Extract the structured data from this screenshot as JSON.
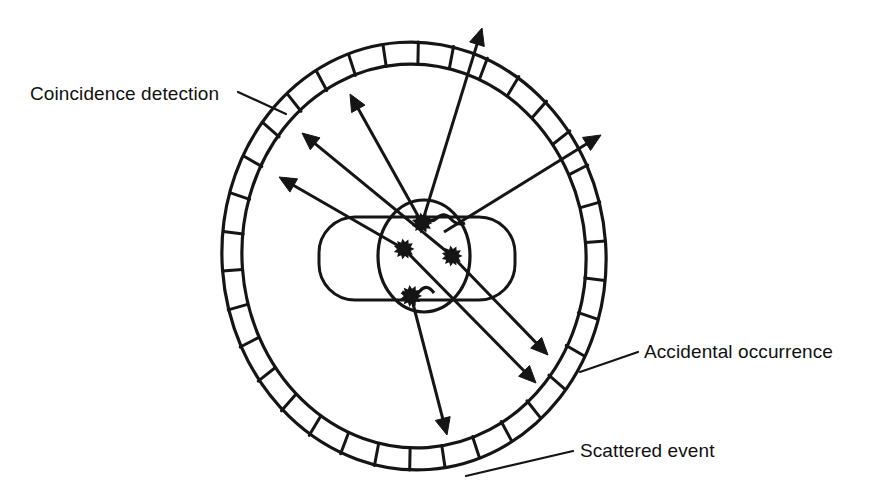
{
  "figure": {
    "background_color": "#ffffff",
    "ink_color": "#151515",
    "width": 878,
    "height": 494
  },
  "labels": [
    {
      "id": "coincidence-detection",
      "text": "Coincidence detection",
      "text_x": 30,
      "text_y": 100,
      "anchor": "start",
      "leader": {
        "x1": 238,
        "y1": 92,
        "x2": 286,
        "y2": 114
      }
    },
    {
      "id": "accidental-occurrence",
      "text": "Accidental occurrence",
      "text_x": 644,
      "text_y": 358,
      "anchor": "start",
      "leader": {
        "x1": 638,
        "y1": 352,
        "x2": 580,
        "y2": 372
      }
    },
    {
      "id": "scattered-event",
      "text": "Scattered event",
      "text_x": 580,
      "text_y": 457,
      "anchor": "start",
      "leader": {
        "x1": 573,
        "y1": 451,
        "x2": 466,
        "y2": 476
      }
    }
  ],
  "detector_ring": {
    "name": "detector-ring",
    "center_x": 414,
    "center_y": 256,
    "outer_rx": 192,
    "outer_ry": 214,
    "inner_rx": 172,
    "inner_ry": 192,
    "block_count": 34,
    "stroke_width": 3.2,
    "rotation_deg": -4
  },
  "patient_bed": {
    "name": "patient-bed",
    "x": 319,
    "y": 217,
    "width": 196,
    "height": 83,
    "corner_radius": 36
  },
  "body_section": {
    "name": "body-cross-section",
    "center_x": 424,
    "center_y": 256,
    "rx": 46,
    "ry": 56
  },
  "event_points": [
    {
      "id": "event-point-1",
      "x": 422,
      "y": 223,
      "r": 9
    },
    {
      "id": "event-point-2",
      "x": 404,
      "y": 249,
      "r": 9
    },
    {
      "id": "event-point-3",
      "x": 452,
      "y": 256,
      "r": 9
    },
    {
      "id": "event-point-4",
      "x": 411,
      "y": 296,
      "r": 9.5
    }
  ],
  "rays": [
    {
      "id": "ray-coincidence-a",
      "kind": "coincidence",
      "x1": 452,
      "y1": 256,
      "x2": 302,
      "y2": 133,
      "arrow": true,
      "arrow_size": 17
    },
    {
      "id": "ray-coincidence-b",
      "kind": "coincidence",
      "x1": 452,
      "y1": 256,
      "x2": 548,
      "y2": 355,
      "arrow": true,
      "arrow_size": 17
    },
    {
      "id": "ray-coincidence-c",
      "kind": "coincidence",
      "x1": 404,
      "y1": 249,
      "x2": 279,
      "y2": 177,
      "arrow": true,
      "arrow_size": 17
    },
    {
      "id": "ray-coincidence-d",
      "kind": "coincidence",
      "x1": 404,
      "y1": 249,
      "x2": 536,
      "y2": 383,
      "arrow": true,
      "arrow_size": 17
    },
    {
      "id": "ray-accidental-a",
      "kind": "accidental",
      "x1": 422,
      "y1": 223,
      "x2": 350,
      "y2": 94,
      "arrow": true,
      "arrow_size": 17
    },
    {
      "id": "ray-accidental-b",
      "kind": "accidental",
      "x1": 422,
      "y1": 223,
      "x2": 482,
      "y2": 28,
      "arrow": true,
      "arrow_size": 17
    },
    {
      "id": "ray-accidental-c",
      "kind": "accidental",
      "x1": 444,
      "y1": 232,
      "x2": 601,
      "y2": 135,
      "arrow": true,
      "arrow_size": 17
    },
    {
      "id": "ray-scattered",
      "kind": "scattered",
      "x1": 411,
      "y1": 296,
      "x2": 447,
      "y2": 435,
      "arrow": true,
      "arrow_size": 17
    }
  ]
}
